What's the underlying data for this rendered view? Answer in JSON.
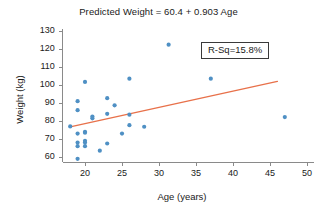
{
  "chart_data": {
    "type": "scatter",
    "title": "Predicted Weight = 60.4 + 0.903 Age",
    "xlabel": "Age (years)",
    "ylabel": "Weight (kg)",
    "xlim": [
      17,
      51
    ],
    "ylim": [
      57,
      131
    ],
    "xticks": [
      20,
      25,
      30,
      35,
      40,
      45,
      50
    ],
    "yticks": [
      60,
      70,
      80,
      90,
      100,
      110,
      120,
      130
    ],
    "grid": false,
    "legend": "none",
    "marker_color": "#4f90c4",
    "line_color": "#e8714a",
    "axis_color": "#8a8a8a",
    "annotation": {
      "text": "R-Sq=15.8%",
      "r_squared_percent": 15.8
    },
    "regression": {
      "equation": "Predicted Weight = 60.4 + 0.903 Age",
      "intercept": 60.4,
      "slope": 0.903,
      "x_start": 18,
      "x_end": 46,
      "y_start": 76.7,
      "y_end": 102.0
    },
    "points": [
      {
        "x": 18.0,
        "y": 77.0
      },
      {
        "x": 19.0,
        "y": 91.0
      },
      {
        "x": 19.0,
        "y": 86.0
      },
      {
        "x": 19.0,
        "y": 73.0
      },
      {
        "x": 19.0,
        "y": 68.0
      },
      {
        "x": 19.0,
        "y": 66.0
      },
      {
        "x": 19.0,
        "y": 59.0
      },
      {
        "x": 20.0,
        "y": 101.7
      },
      {
        "x": 20.0,
        "y": 74.0
      },
      {
        "x": 20.0,
        "y": 73.5
      },
      {
        "x": 20.0,
        "y": 69.0
      },
      {
        "x": 20.0,
        "y": 68.0
      },
      {
        "x": 20.0,
        "y": 66.0
      },
      {
        "x": 21.0,
        "y": 82.5
      },
      {
        "x": 21.0,
        "y": 81.5
      },
      {
        "x": 22.0,
        "y": 63.5
      },
      {
        "x": 23.0,
        "y": 92.7
      },
      {
        "x": 23.0,
        "y": 84.0
      },
      {
        "x": 23.0,
        "y": 67.5
      },
      {
        "x": 24.0,
        "y": 88.7
      },
      {
        "x": 25.0,
        "y": 73.0
      },
      {
        "x": 26.0,
        "y": 103.5
      },
      {
        "x": 26.0,
        "y": 83.5
      },
      {
        "x": 26.0,
        "y": 77.7
      },
      {
        "x": 28.0,
        "y": 76.8
      },
      {
        "x": 31.3,
        "y": 122.4
      },
      {
        "x": 37.0,
        "y": 103.5
      },
      {
        "x": 47.0,
        "y": 82.2
      }
    ]
  }
}
